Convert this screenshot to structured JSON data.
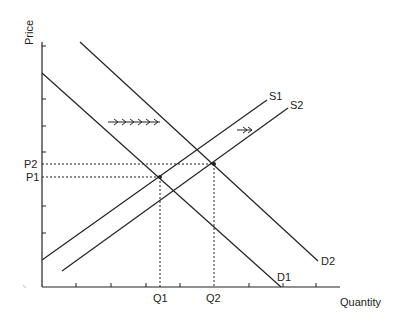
{
  "diagram": {
    "axes": {
      "y_label": "Price",
      "x_label": "Quantity"
    },
    "price_labels": {
      "p1": "P1",
      "p2": "P2"
    },
    "quantity_labels": {
      "q1": "Q1",
      "q2": "Q2"
    },
    "curves": {
      "d1": "D1",
      "d2": "D2",
      "s1": "S1",
      "s2": "S2"
    },
    "annotations": {
      "demand_shift_arrow": "rightward multi-arrow (demand increase)",
      "supply_shift_arrow": "rightward double arrow (supply increase)"
    },
    "colors": {
      "line": "#222222",
      "background": "#ffffff"
    }
  }
}
